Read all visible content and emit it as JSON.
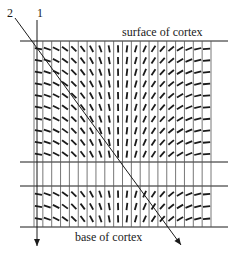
{
  "diagram": {
    "labels": {
      "surface": "surface of cortex",
      "base": "base of cortex",
      "track1": "1",
      "track2": "2"
    },
    "colors": {
      "ink": "#1a1a1a",
      "grid": "#555555",
      "background": "#ffffff"
    },
    "grid": {
      "columns": 20,
      "x_left": 34,
      "x_right": 211,
      "line_x_start": 20,
      "line_x_end": 228,
      "top_y": 41,
      "band_top_y": 162,
      "band_bottom_y": 186,
      "base_y": 227,
      "upper_rows": 10,
      "lower_rows": 3
    },
    "tracks": [
      {
        "id": "1",
        "label_x": 40,
        "label_y": 17,
        "x1": 37,
        "y1": 20,
        "x2": 37,
        "y2": 246
      },
      {
        "id": "2",
        "label_x": 10,
        "label_y": 17,
        "x1": 15,
        "y1": 18,
        "x2": 181,
        "y2": 245
      }
    ],
    "orientation_description": "Orientation preference bars rotate progressively across columns from horizontal (left) through oblique to vertical (center) and back to horizontal (right)"
  }
}
